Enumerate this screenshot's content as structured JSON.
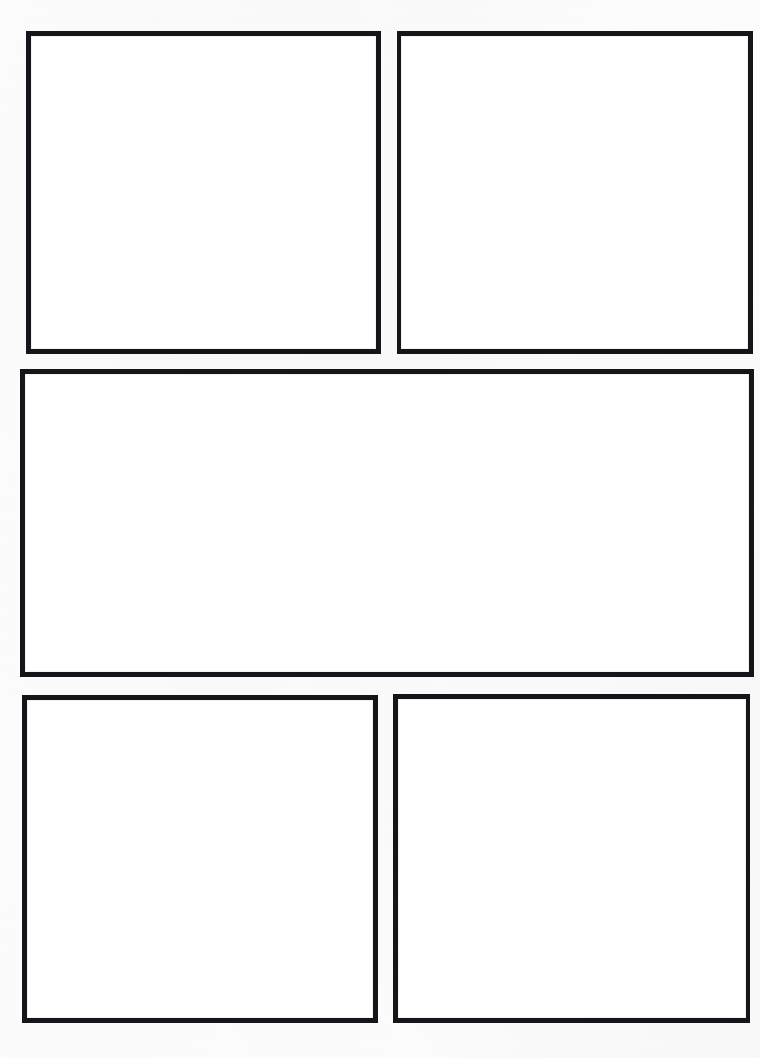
{
  "page": {
    "kind": "blank-comic-page-template",
    "width": 760,
    "height": 1058,
    "background_color": "#fdfdfd",
    "paper_color": "#ffffff",
    "ink_color": "#16161a",
    "border_width_px": 5,
    "panel_count": 5
  },
  "panels": [
    {
      "id": "panel-1",
      "position": "top-left",
      "label": "",
      "x": 26,
      "y": 31,
      "width": 355,
      "height": 323,
      "row": 1,
      "column": 1
    },
    {
      "id": "panel-2",
      "position": "top-right",
      "label": "",
      "x": 397,
      "y": 31,
      "width": 356,
      "height": 323,
      "row": 1,
      "column": 2
    },
    {
      "id": "panel-3",
      "position": "middle-wide",
      "label": "",
      "x": 20,
      "y": 369,
      "width": 734,
      "height": 308,
      "row": 2,
      "column": 1
    },
    {
      "id": "panel-4",
      "position": "bottom-left",
      "label": "",
      "x": 22,
      "y": 695,
      "width": 356,
      "height": 328,
      "row": 3,
      "column": 1
    },
    {
      "id": "panel-5",
      "position": "bottom-right",
      "label": "",
      "x": 393,
      "y": 694,
      "width": 357,
      "height": 329,
      "row": 3,
      "column": 2
    }
  ]
}
